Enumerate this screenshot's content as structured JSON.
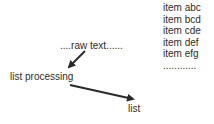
{
  "diagram": {
    "nodes": {
      "raw_text": "....raw text......",
      "list_processing": "list processing",
      "list": "list"
    },
    "items": [
      "item abc",
      "item bcd",
      "item cde",
      "item def",
      "item efg",
      "............"
    ],
    "edges": [
      {
        "from": "raw_text",
        "to": "list_processing"
      },
      {
        "from": "list_processing",
        "to": "list"
      }
    ],
    "colors": {
      "text": "#2c2c2c",
      "arrow": "#2a2a2a",
      "background": "#ffffff"
    }
  }
}
